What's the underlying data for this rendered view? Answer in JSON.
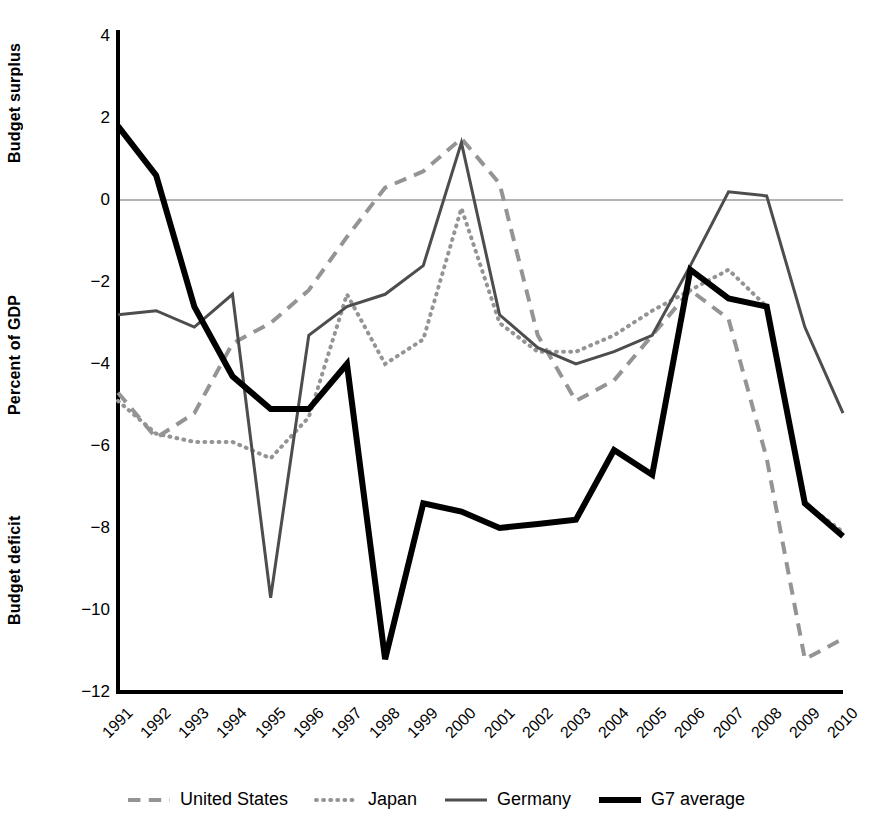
{
  "chart_data": {
    "type": "line",
    "title": "",
    "subtitle": "",
    "xlabel": "",
    "ylabel": "Percent of GDP",
    "ylabel_top": "Budget surplus",
    "ylabel_bottom": "Budget deficit",
    "ylim": [
      -12,
      4
    ],
    "yticks": [
      4,
      2,
      0,
      -2,
      -4,
      -6,
      -8,
      -10,
      -12
    ],
    "ytick_labels": [
      "4",
      "2",
      "0",
      "−2",
      "−4",
      "−6",
      "−8",
      "−10",
      "−12"
    ],
    "grid": false,
    "zero_line": true,
    "legend_position": "bottom",
    "categories": [
      "1991",
      "1992",
      "1993",
      "1994",
      "1995",
      "1996",
      "1997",
      "1998",
      "1999",
      "2000",
      "2001",
      "2002",
      "2003",
      "2004",
      "2005",
      "2006",
      "2007",
      "2008",
      "2009",
      "2010"
    ],
    "series": [
      {
        "name": "United States",
        "style": "dashed",
        "color": "#949494",
        "width": 4,
        "values": [
          -4.7,
          -5.8,
          -5.2,
          -3.5,
          -3.0,
          -2.2,
          -0.9,
          0.3,
          0.7,
          1.5,
          0.4,
          -3.3,
          -4.9,
          -4.4,
          -3.3,
          -2.2,
          -2.9,
          -6.3,
          -11.2,
          -10.7
        ]
      },
      {
        "name": "Japan",
        "style": "dotted",
        "color": "#949494",
        "width": 4,
        "values": [
          -4.9,
          -5.7,
          -5.9,
          -5.9,
          -6.3,
          -5.3,
          -2.3,
          -4.0,
          -3.4,
          -0.2,
          -3.0,
          -3.7,
          -3.7,
          -3.3,
          -2.7,
          -2.2,
          -1.7,
          -2.6,
          -7.4,
          -8.1
        ]
      },
      {
        "name": "Germany",
        "style": "solid",
        "color": "#4d4d4d",
        "width": 3,
        "values": [
          -2.8,
          -2.7,
          -3.1,
          -2.3,
          -9.7,
          -3.3,
          -2.6,
          -2.3,
          -1.6,
          1.4,
          -2.8,
          -3.6,
          -4.0,
          -3.7,
          -3.3,
          -1.6,
          0.2,
          0.1,
          -3.1,
          -5.2
        ]
      },
      {
        "name": "G7 average",
        "style": "solid",
        "color": "#000000",
        "width": 6,
        "values": [
          1.8,
          0.6,
          -2.6,
          -4.3,
          -5.1,
          -5.1,
          -4.0,
          -11.2,
          -7.4,
          -7.6,
          -8.0,
          -7.9,
          -7.8,
          -6.1,
          -6.7,
          -1.7,
          -2.4,
          -2.6,
          -7.4,
          -8.2
        ]
      }
    ]
  },
  "legend": {
    "items": [
      {
        "label": "United States"
      },
      {
        "label": "Japan"
      },
      {
        "label": "Germany"
      },
      {
        "label": "G7 average"
      }
    ]
  },
  "axis_labels": {
    "top": "Budget surplus",
    "middle": "Percent of GDP",
    "bottom": "Budget deficit"
  },
  "colors": {
    "us": "#949494",
    "japan": "#949494",
    "germany": "#4d4d4d",
    "g7": "#000000",
    "axis": "#000000",
    "zero_line": "#9a9a9a",
    "background": "#ffffff"
  }
}
